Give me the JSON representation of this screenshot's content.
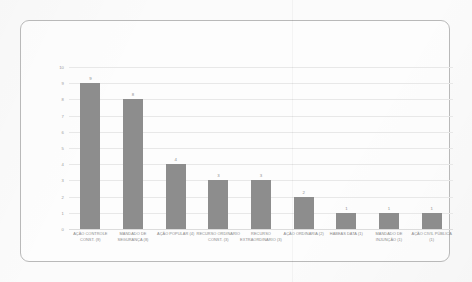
{
  "chart_data": {
    "type": "bar",
    "title": "",
    "subtitle": "",
    "xlabel": "",
    "ylabel": "",
    "ylim": [
      0,
      10
    ],
    "ytick_values": [
      0,
      1,
      2,
      3,
      4,
      5,
      6,
      7,
      8,
      9,
      10
    ],
    "ytick_labels": [
      "0",
      "1",
      "2",
      "3",
      "4",
      "5",
      "6",
      "7",
      "8",
      "9",
      "10"
    ],
    "grid": true,
    "legend": false,
    "legend_position": "none",
    "bar_color": "#8d8d8d",
    "show_value_labels": true,
    "categories": [
      "AÇÃO CONTROLE CONST. (9)",
      "MANDADO DE SEGURANÇA (8)",
      "AÇÃO POPULAR (4)",
      "RECURSO ORDINÁRIO CONST. (3)",
      "RECURSO EXTRAORDINÁRIO (3)",
      "AÇÃO ORDINÁRIA (2)",
      "HABEAS DATA (1)",
      "MANDADO DE INJUNÇÃO (1)",
      "AÇÃO CIVIL PÚBLICA (1)"
    ],
    "values": [
      9,
      8,
      4,
      3,
      3,
      2,
      1,
      1,
      1
    ],
    "value_labels": [
      "9",
      "8",
      "4",
      "3",
      "3",
      "2",
      "1",
      "1",
      "1"
    ]
  },
  "colors": {
    "bar": "#8d8d8d",
    "gridline": "#e8e8e8",
    "axis_text": "#9a9a9a",
    "label_text": "#8a8a8a",
    "card_border": "#b9b9b9",
    "page_background": "#fbfbfb"
  }
}
